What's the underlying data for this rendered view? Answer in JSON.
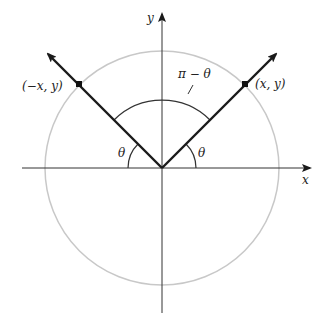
{
  "diagram": {
    "type": "unit-circle-angle-reflection",
    "axes": {
      "x_label": "x",
      "y_label": "y"
    },
    "points": {
      "left": {
        "label": "(−x, y)"
      },
      "right": {
        "label": "(x, y)"
      }
    },
    "angles": {
      "left_theta": "θ",
      "right_theta": "θ",
      "between": "π − θ"
    },
    "colors": {
      "circle": "#c8c8c8",
      "lines": "#1a1a1a",
      "axes": "#333333"
    }
  }
}
